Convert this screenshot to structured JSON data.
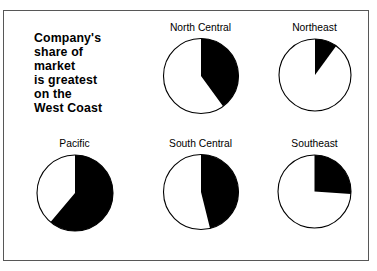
{
  "figure": {
    "headline": "Company's\nshare of\nmarket\nis greatest\non the\nWest Coast",
    "background_color": "#ffffff",
    "frame_color": "#575757",
    "wedge_color": "#000000",
    "outline_color": "#000000"
  },
  "chart_data": {
    "type": "pie",
    "title": "Company's share of market is greatest on the West Coast",
    "subtitle": "",
    "xlabel": "",
    "ylabel": "",
    "legend_position": "none",
    "grid": false,
    "note": "Six-panel small-multiple of pie charts; each pie shows the company's market share in one region. Black wedge = company share, white remainder = rest of market. All wedges start at 12 o'clock and sweep clockwise.",
    "slice_labels": [
      "Company share",
      "Rest of market"
    ],
    "panels": [
      {
        "name": "headline",
        "kind": "text",
        "row": 0,
        "column": 0,
        "label": "",
        "share_percent": null,
        "remainder_percent": null,
        "sweep_degrees": null
      },
      {
        "name": "north-central",
        "kind": "pie",
        "row": 0,
        "column": 1,
        "label": "North Central",
        "share_percent": 40,
        "remainder_percent": 60,
        "sweep_degrees": 144
      },
      {
        "name": "northeast",
        "kind": "pie",
        "row": 0,
        "column": 2,
        "label": "Northeast",
        "share_percent": 10,
        "remainder_percent": 90,
        "sweep_degrees": 36
      },
      {
        "name": "pacific",
        "kind": "pie",
        "row": 1,
        "column": 0,
        "label": "Pacific",
        "share_percent": 61,
        "remainder_percent": 39,
        "sweep_degrees": 220
      },
      {
        "name": "south-central",
        "kind": "pie",
        "row": 1,
        "column": 1,
        "label": "South Central",
        "share_percent": 46,
        "remainder_percent": 54,
        "sweep_degrees": 166
      },
      {
        "name": "southeast",
        "kind": "pie",
        "row": 1,
        "column": 2,
        "label": "Southeast",
        "share_percent": 26,
        "remainder_percent": 74,
        "sweep_degrees": 94
      }
    ],
    "categories": [
      "North Central",
      "Northeast",
      "Pacific",
      "South Central",
      "Southeast"
    ],
    "values": [
      40,
      10,
      61,
      46,
      26
    ],
    "series": [
      {
        "name": "Company share",
        "values": [
          40,
          10,
          61,
          46,
          26
        ]
      },
      {
        "name": "Rest of market",
        "values": [
          60,
          90,
          39,
          54,
          74
        ]
      }
    ]
  },
  "geometry": {
    "pie_radius_px": [
      37.5,
      36,
      38,
      37.5,
      36.5
    ]
  }
}
